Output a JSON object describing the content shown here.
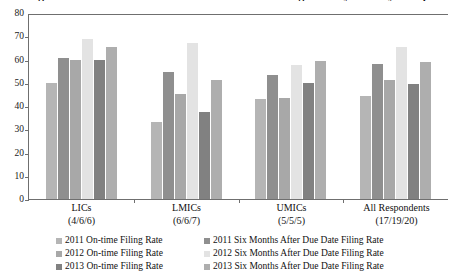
{
  "chart_data": {
    "type": "bar",
    "title": "Figure 3. On-time and Six Months After Due Date Filing Rates by Country Group",
    "xlabel": "",
    "ylabel": "",
    "ylim": [
      0,
      80
    ],
    "ytick_step": 10,
    "yticks": [
      "0",
      "10",
      "20",
      "30",
      "40",
      "50",
      "60",
      "70",
      "80"
    ],
    "grid": false,
    "legend_position": "bottom",
    "categories": [
      "LICs",
      "LMICs",
      "UMICs",
      "All Respondents"
    ],
    "category_sublabels": [
      "(4/6/6)",
      "(6/6/7)",
      "(5/5/5)",
      "(17/19/20)"
    ],
    "series": [
      {
        "name": "2011 On-time Filing Rate",
        "color": "#b5b5b5",
        "values": [
          50,
          33,
          43,
          44.5
        ]
      },
      {
        "name": "2011 Six Months After Due Date Filing Rate",
        "color": "#8f8f8f",
        "values": [
          60.5,
          54.5,
          53.5,
          58
        ]
      },
      {
        "name": "2012 On-time Filing Rate",
        "color": "#a8a8a8",
        "values": [
          60,
          45,
          43.5,
          51
        ]
      },
      {
        "name": "2012 Six Months After Due Date Filing Rate",
        "color": "#e3e3e3",
        "values": [
          69,
          67,
          57.5,
          65.5
        ]
      },
      {
        "name": "2013 On-time Filing Rate",
        "color": "#818181",
        "values": [
          60,
          37.5,
          50,
          49.5
        ]
      },
      {
        "name": "2013 Six Months After Due Date Filing Rate",
        "color": "#aeaeae",
        "values": [
          65.5,
          51,
          59.5,
          59
        ]
      }
    ]
  }
}
